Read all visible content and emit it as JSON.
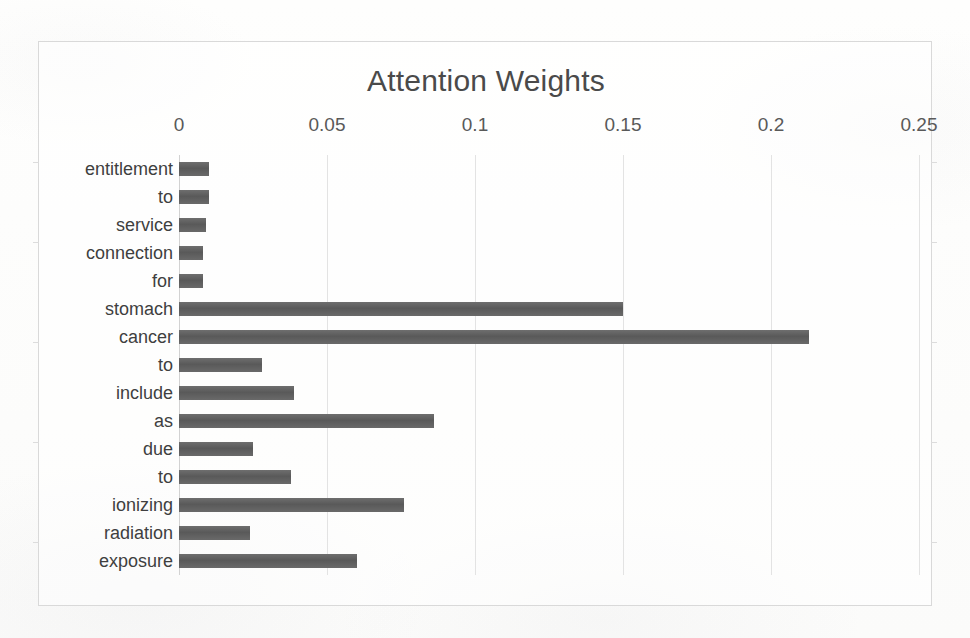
{
  "chart": {
    "title": "Attention Weights",
    "frame_color": "#d9d9d9",
    "bar_color": "#5e5e5e",
    "gridline_color": "#e3e3e3",
    "background_color": "#fdfdfc"
  },
  "chart_data": {
    "type": "bar",
    "orientation": "horizontal",
    "title": "Attention Weights",
    "xlabel": "",
    "ylabel": "",
    "xlim": [
      0,
      0.25
    ],
    "grid": true,
    "legend": false,
    "xticks": [
      "0",
      "0.05",
      "0.1",
      "0.15",
      "0.2",
      "0.25"
    ],
    "xtick_values": [
      0,
      0.05,
      0.1,
      0.15,
      0.2,
      0.25
    ],
    "categories": [
      "entitlement",
      "to",
      "service",
      "connection",
      "for",
      "stomach",
      "cancer",
      "to",
      "include",
      "as",
      "due",
      "to",
      "ionizing",
      "radiation",
      "exposure"
    ],
    "values": [
      0.01,
      0.01,
      0.009,
      0.008,
      0.008,
      0.15,
      0.213,
      0.028,
      0.039,
      0.086,
      0.025,
      0.038,
      0.076,
      0.024,
      0.06
    ]
  }
}
